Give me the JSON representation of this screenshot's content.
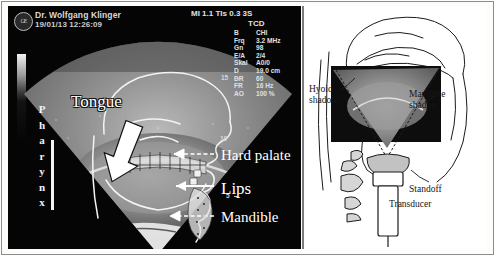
{
  "figure": {
    "type": "ultrasound-figure",
    "panels": [
      "ultrasound-bmode",
      "anatomical-schematic"
    ]
  },
  "ultrasound": {
    "header": {
      "logo_text": "GE",
      "physician": "Dr. Wolfgang Klinger",
      "datetime": "19/01/13 12:26:09",
      "acoustic_output": "MI 1.1  TIs 0.3  3S",
      "probe_mode": "TCD"
    },
    "parameters": [
      {
        "key": "B",
        "value": "CHI"
      },
      {
        "key": "Frq",
        "value": "3.2 MHz"
      },
      {
        "key": "Gn",
        "value": "98"
      },
      {
        "key": "E/A",
        "value": "2/4"
      },
      {
        "key": "Skal",
        "value": "A0/0"
      },
      {
        "key": "D",
        "value": "19.0 cm"
      },
      {
        "key": "DR",
        "value": "60"
      },
      {
        "key": "FR",
        "value": "16 Hz"
      },
      {
        "key": "AO",
        "value": "100 %"
      }
    ],
    "depth_ticks": [
      "15",
      "10",
      "5"
    ],
    "annotations": {
      "pharynx": "Pharynx",
      "tongue": "Tongue",
      "hard_palate": "Hard palate",
      "lips": "Lips",
      "mandible": "Mandible"
    }
  },
  "schematic": {
    "labels": {
      "hyoid_shadow_line1": "Hyoid",
      "hyoid_shadow_line2": "shadow",
      "mandible_shadow_line1": "Mandible",
      "mandible_shadow_line2": "shadow",
      "standoff": "Standoff",
      "transducer": "Transducer"
    }
  },
  "colors": {
    "screen_black": "#050505",
    "fan_gray": "#8e8e8e",
    "label_white": "#ffffff",
    "paper_white": "#ffffff",
    "ink": "#151515"
  }
}
